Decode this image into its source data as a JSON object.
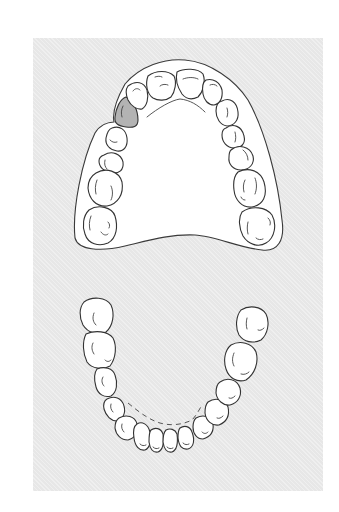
{
  "figure": {
    "background_color": "#e7e7e7",
    "tooth_fill": "#ffffff",
    "highlight_fill": "#b3b3b3",
    "line_color": "#333333"
  },
  "upper_arch": {
    "label": "Maxillary arch",
    "tooth_count": 13,
    "highlighted_tooth": "upper canine (viewer's left)"
  },
  "lower_arch": {
    "label": "Mandibular arch",
    "tooth_count": 14
  }
}
